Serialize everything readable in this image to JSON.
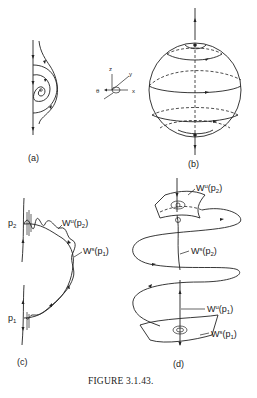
{
  "figure": {
    "caption": "FIGURE 3.1.43.",
    "panels": [
      {
        "id": "a",
        "label": "(a)"
      },
      {
        "id": "b",
        "label": "(b)"
      },
      {
        "id": "c",
        "label": "(c)"
      },
      {
        "id": "d",
        "label": "(d)"
      }
    ],
    "axes": {
      "z": "z",
      "y": "y",
      "x": "x",
      "theta": "θ"
    },
    "panel_c": {
      "p2": "p",
      "p2_sub": "2",
      "p1": "p",
      "p1_sub": "1",
      "wu_p2": {
        "W": "W",
        "sup": "u",
        "arg": "(p",
        "sub": "2",
        "close": ")"
      },
      "ws_p1": {
        "W": "W",
        "sup": "s",
        "arg": "(p",
        "sub": "1",
        "close": ")"
      }
    },
    "panel_d": {
      "wu_p2": {
        "W": "W",
        "sup": "u",
        "arg": "(p",
        "sub": "2",
        "close": ")"
      },
      "ws_p2": {
        "W": "W",
        "sup": "s",
        "arg": "(p",
        "sub": "2",
        "close": ")"
      },
      "wu_p1": {
        "W": "W",
        "sup": "u",
        "arg": "(p",
        "sub": "1",
        "close": ")"
      },
      "ws_p1": {
        "W": "W",
        "sup": "s",
        "arg": "(p",
        "sub": "1",
        "close": ")"
      }
    }
  }
}
